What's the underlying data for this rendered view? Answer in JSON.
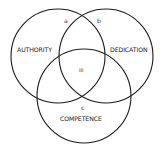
{
  "diagram": {
    "type": "venn",
    "circles": [
      {
        "id": "authority",
        "label": "AUTHORITY",
        "cx": 58,
        "cy": 56,
        "r": 47
      },
      {
        "id": "dedication",
        "label": "DEDICATION",
        "cx": 106,
        "cy": 56,
        "r": 47
      },
      {
        "id": "competence",
        "label": "COMPETENCE",
        "cx": 84,
        "cy": 96,
        "r": 47
      }
    ],
    "region_labels": {
      "a": "a",
      "b": "b",
      "c": "c",
      "center": "III"
    },
    "stroke_color": "#1a1a1a",
    "background": "#ffffff"
  }
}
